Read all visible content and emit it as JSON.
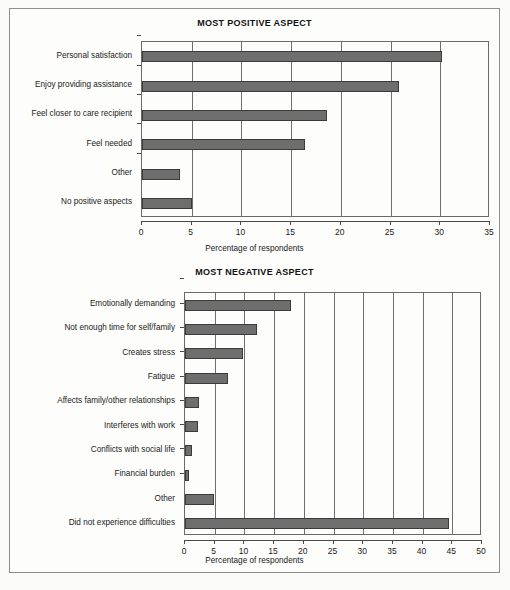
{
  "figure": {
    "background": "#fdfdfc",
    "bar_color": "#6e6e6e",
    "bar_border": "#3b3b3b",
    "axis_color": "#4a4a4a"
  },
  "chart_data": [
    {
      "type": "bar",
      "orientation": "horizontal",
      "title": "MOST POSITIVE ASPECT",
      "xlabel": "Percentage of respondents",
      "ylabel": "",
      "xlim": [
        0,
        35
      ],
      "xticks": [
        0,
        5,
        10,
        15,
        20,
        25,
        30,
        35
      ],
      "xtick_labels": [
        "0",
        "5",
        "10",
        "15",
        "20",
        "25",
        "30",
        "35"
      ],
      "grid": true,
      "legend": false,
      "categories": [
        "Personal satisfaction",
        "Enjoy providing assistance",
        "Feel closer to care recipient",
        "Feel needed",
        "Other",
        "No positive aspects"
      ],
      "values": [
        30.2,
        25.8,
        18.6,
        16.4,
        3.8,
        5.0
      ]
    },
    {
      "type": "bar",
      "orientation": "horizontal",
      "title": "MOST NEGATIVE ASPECT",
      "xlabel": "Percentage of respondents",
      "ylabel": "",
      "xlim": [
        0,
        50
      ],
      "xticks": [
        0,
        5,
        10,
        15,
        20,
        25,
        30,
        35,
        40,
        45,
        50
      ],
      "xtick_labels": [
        "0",
        "5",
        "10",
        "15",
        "20",
        "25",
        "30",
        "35",
        "40",
        "45",
        "50"
      ],
      "grid": true,
      "legend": false,
      "categories": [
        "Emotionally demanding",
        "Not enough time for self/family",
        "Creates stress",
        "Fatigue",
        "Affects family/other relationships",
        "Interferes with work",
        "Conflicts with social life",
        "Financial burden",
        "Other",
        "Did not experience difficulties"
      ],
      "values": [
        17.8,
        12.1,
        9.8,
        7.2,
        2.3,
        2.2,
        1.1,
        0.6,
        4.8,
        44.5
      ]
    }
  ]
}
